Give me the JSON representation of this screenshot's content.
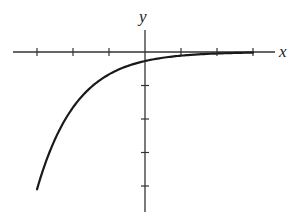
{
  "chart_data": {
    "type": "line",
    "title": "",
    "xlabel": "x",
    "ylabel": "y",
    "xlim": [
      -3.6,
      3.6
    ],
    "ylim": [
      -4.75,
      1.2
    ],
    "x_ticks": [
      -3,
      -2,
      -1,
      1,
      2,
      3
    ],
    "y_ticks": [
      -1,
      -2,
      -3,
      -4
    ],
    "tick_labels_shown": false,
    "grid": false,
    "legend": null,
    "series": [
      {
        "name": "curve",
        "color": "#1a1a1a",
        "x": [
          -3.0,
          -2.5,
          -2.0,
          -1.5,
          -1.0,
          -0.5,
          0.0,
          0.5,
          1.0,
          1.5,
          2.0,
          2.5,
          3.0
        ],
        "y": [
          -4.1,
          -2.6,
          -1.6,
          -1.0,
          -0.63,
          -0.42,
          -0.27,
          -0.17,
          -0.11,
          -0.07,
          -0.045,
          -0.03,
          -0.02
        ]
      }
    ],
    "colors": {
      "axis": "#333333",
      "curve": "#1a1a1a",
      "background": "#ffffff"
    }
  }
}
